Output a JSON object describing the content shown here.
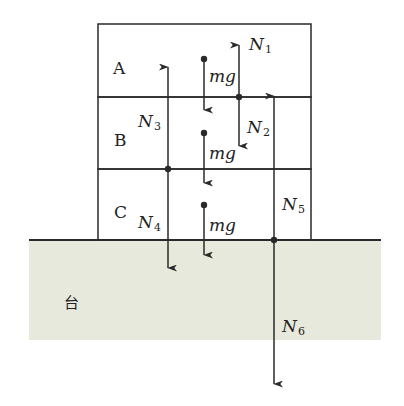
{
  "colors": {
    "line": "#2a2a2a",
    "ground_fill": "#e6e9dc",
    "background": "#ffffff"
  },
  "blocks": [
    {
      "label": "A",
      "weight_label": "mg"
    },
    {
      "label": "B",
      "weight_label": "mg"
    },
    {
      "label": "C",
      "weight_label": "mg"
    }
  ],
  "ground": {
    "label": "台"
  },
  "forces": [
    {
      "name": "N",
      "sub": "1",
      "direction": "up",
      "acts_on": "A"
    },
    {
      "name": "N",
      "sub": "2",
      "direction": "down",
      "acts_on": "B"
    },
    {
      "name": "N",
      "sub": "3",
      "direction": "up",
      "acts_on": "B"
    },
    {
      "name": "N",
      "sub": "4",
      "direction": "down",
      "acts_on": "C"
    },
    {
      "name": "N",
      "sub": "5",
      "direction": "up",
      "acts_on": "C"
    },
    {
      "name": "N",
      "sub": "6",
      "direction": "down",
      "acts_on": "台"
    }
  ]
}
